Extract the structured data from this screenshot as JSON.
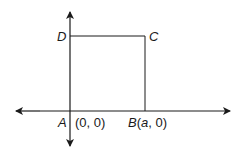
{
  "diagram": {
    "type": "coordinate-geometry-square",
    "points": [
      {
        "name": "A",
        "label": "A",
        "coords": "(0, 0)"
      },
      {
        "name": "B",
        "label": "B",
        "coords": "(a, 0)"
      },
      {
        "name": "C",
        "label": "C"
      },
      {
        "name": "D",
        "label": "D"
      }
    ],
    "labels": {
      "D": "D",
      "C": "C",
      "A": "A",
      "A_coords": "(0, 0)",
      "B": "B",
      "B_paren_open": "(",
      "B_var": "a",
      "B_rest": ", 0)"
    },
    "colors": {
      "line": "#1a1a1a",
      "background": "#ffffff"
    }
  }
}
